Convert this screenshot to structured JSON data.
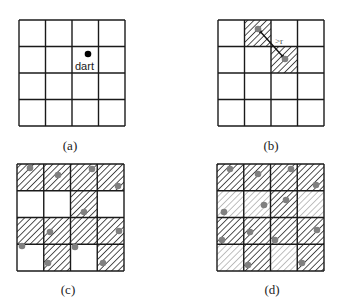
{
  "panels": [
    {
      "id": "a",
      "caption": "(a)",
      "x": 19,
      "y": 20,
      "size": 106,
      "hatch": [
        [
          0,
          0,
          0,
          0
        ],
        [
          0,
          0,
          0,
          0
        ],
        [
          0,
          0,
          0,
          0
        ],
        [
          0,
          0,
          0,
          0
        ]
      ],
      "dots": [],
      "dart": {
        "x": 88,
        "y": 54,
        "label": "dart"
      }
    },
    {
      "id": "b",
      "caption": "(b)",
      "x": 218,
      "y": 20,
      "size": 106,
      "hatch": [
        [
          0,
          2,
          0,
          0
        ],
        [
          0,
          0,
          2,
          0
        ],
        [
          0,
          0,
          0,
          0
        ],
        [
          0,
          0,
          0,
          0
        ]
      ],
      "dots": [
        [
          258,
          29
        ],
        [
          285,
          59
        ]
      ],
      "arrow": {
        "x1": 258,
        "y1": 29,
        "x2": 285,
        "y2": 59,
        "label": ">r"
      }
    },
    {
      "id": "c",
      "caption": "(c)",
      "x": 17,
      "y": 164,
      "size": 107,
      "hatch": [
        [
          2,
          2,
          2,
          2
        ],
        [
          0,
          0,
          2,
          0
        ],
        [
          2,
          2,
          2,
          2
        ],
        [
          0,
          2,
          0,
          2
        ]
      ],
      "dots": [
        [
          30,
          168
        ],
        [
          58,
          175
        ],
        [
          92,
          169
        ],
        [
          118,
          186
        ],
        [
          84,
          212
        ],
        [
          50,
          232
        ],
        [
          119,
          231
        ],
        [
          22,
          246
        ],
        [
          75,
          247
        ],
        [
          48,
          263
        ],
        [
          103,
          263
        ]
      ]
    },
    {
      "id": "d",
      "caption": "(d)",
      "x": 217,
      "y": 164,
      "size": 107,
      "hatch": [
        [
          2,
          2,
          2,
          2
        ],
        [
          1,
          1,
          2,
          1
        ],
        [
          2,
          2,
          2,
          2
        ],
        [
          1,
          2,
          1,
          2
        ]
      ],
      "dots": [
        [
          230,
          169
        ],
        [
          258,
          174
        ],
        [
          291,
          169
        ],
        [
          316,
          185
        ],
        [
          224,
          212
        ],
        [
          264,
          205
        ],
        [
          286,
          200
        ],
        [
          250,
          232
        ],
        [
          317,
          230
        ],
        [
          222,
          240
        ],
        [
          275,
          240
        ],
        [
          248,
          265
        ],
        [
          302,
          263
        ]
      ]
    }
  ],
  "labels": {
    "a": "(a)",
    "b": "(b)",
    "c": "(c)",
    "d": "(d)",
    "dart": "dart",
    "r": ">r"
  },
  "colors": {
    "grid": "#1a1a1a",
    "hatch_dark": "#2a2a2a",
    "hatch_light": "#a8a8a8",
    "dot": "#808080",
    "dart": "#000000"
  }
}
